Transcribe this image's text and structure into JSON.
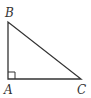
{
  "diagram": {
    "type": "right-triangle",
    "vertices": [
      {
        "name": "B",
        "x": 8,
        "y": 22
      },
      {
        "name": "A",
        "x": 8,
        "y": 79
      },
      {
        "name": "C",
        "x": 81,
        "y": 79
      }
    ],
    "labels": {
      "b": "B",
      "a": "A",
      "c": "C"
    },
    "right_angle_at": "A",
    "stroke_color": "#333333",
    "background": "#ffffff"
  }
}
